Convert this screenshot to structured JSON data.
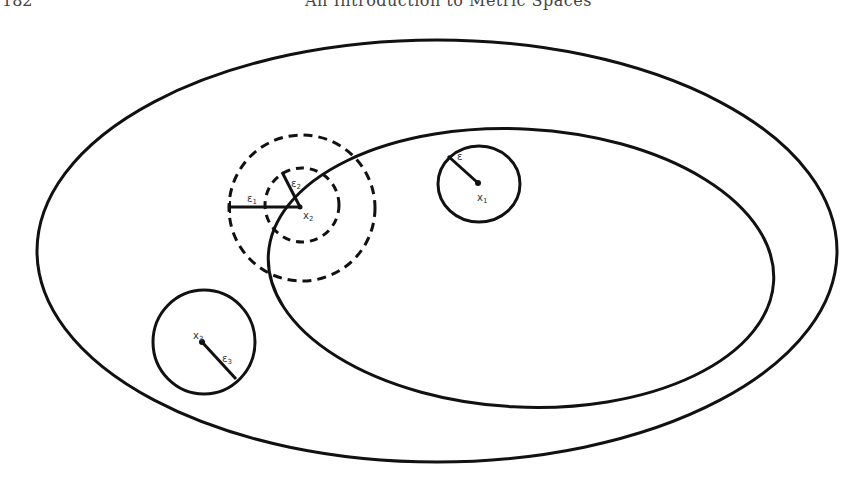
{
  "header": {
    "page_number": "182",
    "running_title": "An Introduction to Metric Spaces"
  },
  "diagram": {
    "colors": {
      "stroke": "#111111",
      "background": "#ffffff"
    },
    "outer_ellipse": {
      "cx": 437,
      "cy": 251,
      "rx": 400,
      "ry": 211
    },
    "inner_ellipse": {
      "cx": 521,
      "cy": 268,
      "rx": 253,
      "ry": 139,
      "rotate": 3
    },
    "points": [
      {
        "id": "x1",
        "label": "x₁",
        "cx": 478,
        "cy": 183,
        "circle_rx": 41,
        "circle_ry": 38,
        "circle_cx": 479,
        "circle_cy": 184,
        "style": "solid",
        "radius_end": [
          448,
          156
        ],
        "radius_label": "ε",
        "radius_label_pos": [
          457,
          157
        ],
        "point_label_pos": [
          477,
          200
        ]
      },
      {
        "id": "x2",
        "label": "x₂",
        "cx": 300,
        "cy": 207,
        "style": "dashed",
        "circles": [
          {
            "r": 73,
            "cx": 302,
            "cy": 208,
            "label": "ε₁"
          },
          {
            "r": 37,
            "cx": 302,
            "cy": 205,
            "label": "ε₂"
          }
        ],
        "radius1_end": [
          230,
          207
        ],
        "radius1_label_pos": [
          248,
          201
        ],
        "radius2_end": [
          282,
          172
        ],
        "radius2_label_pos": [
          291,
          184
        ],
        "point_label_pos": [
          303,
          218
        ]
      },
      {
        "id": "x3",
        "label": "x₃",
        "cx": 202,
        "cy": 342,
        "circle_rx": 51,
        "circle_ry": 52,
        "circle_cx": 204,
        "circle_cy": 342,
        "style": "solid",
        "radius_end": [
          236,
          379
        ],
        "radius_label": "ε₃",
        "radius_label_pos": [
          222,
          360
        ],
        "point_label_pos": [
          193,
          338
        ]
      }
    ]
  }
}
